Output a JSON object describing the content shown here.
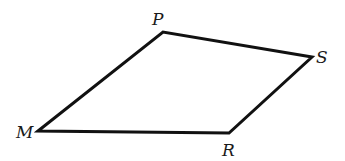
{
  "diagram": {
    "type": "quadrilateral",
    "stroke_color": "#111111",
    "vertices": [
      {
        "label": "P",
        "x": 163,
        "y": 32,
        "label_x": 152,
        "label_y": 25
      },
      {
        "label": "S",
        "x": 312,
        "y": 57,
        "label_x": 316,
        "label_y": 63
      },
      {
        "label": "R",
        "x": 229,
        "y": 133,
        "label_x": 222,
        "label_y": 156
      },
      {
        "label": "M",
        "x": 38,
        "y": 131,
        "label_x": 16,
        "label_y": 138
      }
    ],
    "edges": [
      {
        "from": "M",
        "to": "P"
      },
      {
        "from": "P",
        "to": "S"
      },
      {
        "from": "S",
        "to": "R"
      },
      {
        "from": "R",
        "to": "M"
      }
    ]
  }
}
